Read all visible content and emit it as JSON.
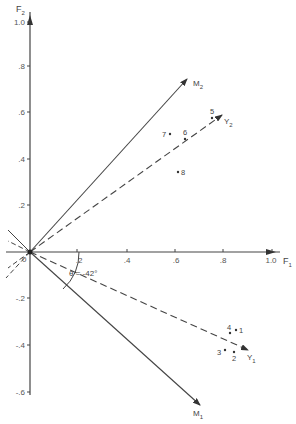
{
  "figure": {
    "axes": {
      "x": {
        "label": "F",
        "subscript": "1",
        "ticks": [
          ".2",
          ".4",
          ".6",
          ".8",
          "1.0"
        ],
        "origin_label": "0"
      },
      "y": {
        "label": "F",
        "subscript": "2",
        "ticks": [
          "1.0",
          ".8",
          ".6",
          ".4",
          ".2",
          "-.2",
          "-.4",
          "-.6"
        ]
      }
    },
    "vectors": [
      {
        "name": "M",
        "subscript": "2",
        "style": "solid"
      },
      {
        "name": "Y",
        "subscript": "2",
        "style": "dashed"
      },
      {
        "name": "Y",
        "subscript": "1",
        "style": "dashed"
      },
      {
        "name": "M",
        "subscript": "1",
        "style": "solid"
      }
    ],
    "angle_label": "θ = -42°",
    "points": [
      {
        "label": "1",
        "x": 0.85,
        "y": -0.32
      },
      {
        "label": "2",
        "x": 0.84,
        "y": -0.43
      },
      {
        "label": "3",
        "x": 0.8,
        "y": -0.42
      },
      {
        "label": "4",
        "x": 0.82,
        "y": -0.33
      },
      {
        "label": "5",
        "x": 0.74,
        "y": 0.58
      },
      {
        "label": "6",
        "x": 0.63,
        "y": 0.48
      },
      {
        "label": "7",
        "x": 0.57,
        "y": 0.5
      },
      {
        "label": "8",
        "x": 0.6,
        "y": 0.35
      }
    ]
  }
}
